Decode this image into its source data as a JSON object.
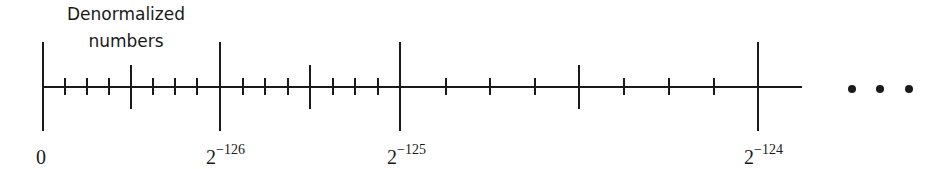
{
  "annotation": {
    "line1": "Denormalized",
    "line2": "numbers"
  },
  "labels": [
    {
      "base": "0",
      "exponent": "",
      "x": 43
    },
    {
      "base": "2",
      "exponent": "−126",
      "x": 220
    },
    {
      "base": "2",
      "exponent": "−125",
      "x": 400
    },
    {
      "base": "2",
      "exponent": "−124",
      "x": 758
    }
  ],
  "axis": {
    "y": 87,
    "x_start": 43,
    "x_end": 802,
    "color": "#1a1a1a"
  },
  "ticks": {
    "major": [
      43,
      220,
      400,
      758
    ],
    "medium": [
      131,
      310,
      579
    ],
    "minor": [
      65,
      87,
      109,
      153,
      175,
      197,
      243,
      265,
      288,
      333,
      355,
      378,
      446,
      490,
      535,
      624,
      669,
      714
    ]
  },
  "ellipsis": {
    "symbol": "• • •",
    "dots_x": [
      852,
      880,
      909
    ],
    "y": 89
  }
}
